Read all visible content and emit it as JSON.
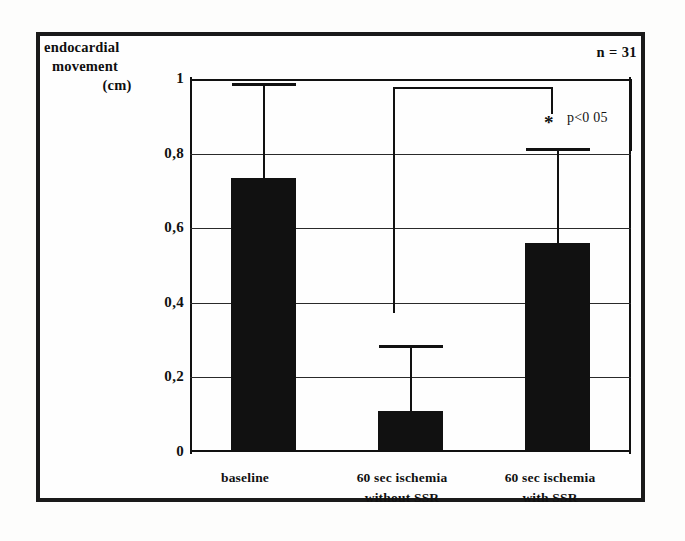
{
  "figure": {
    "axis_title_lines": [
      "endocardial",
      "movement",
      "(cm)"
    ],
    "n_label": "n = 31",
    "p_label": "p<0 05",
    "significance_marker": "*"
  },
  "chart_data": {
    "type": "bar",
    "title": "",
    "xlabel": "",
    "ylabel": "endocardial movement (cm)",
    "ylim": [
      0,
      1
    ],
    "grid": true,
    "legend": "none",
    "ytick_labels": [
      "1",
      "0,8",
      "0,6",
      "0,4",
      "0,2",
      "0"
    ],
    "ytick_values": [
      1,
      0.8,
      0.6,
      0.4,
      0.2,
      0
    ],
    "categories": [
      "baseline",
      "60 sec ischemia without SSR",
      "60 sec ischemia with SSR"
    ],
    "category_label_lines": [
      [
        "baseline"
      ],
      [
        "60 sec ischemia",
        "without SSR"
      ],
      [
        "60 sec ischemia",
        "with SSR"
      ]
    ],
    "values": [
      0.73,
      0.105,
      0.555
    ],
    "error_upper": [
      0.99,
      0.287,
      0.815
    ],
    "annotations": [
      {
        "text": "*",
        "applies_to": "60 sec ischemia with SSR",
        "meaning": "p<0 05"
      },
      {
        "text": "n = 31",
        "meaning": "sample size"
      }
    ],
    "bar_color": "#111111",
    "axis_color": "#111111",
    "background_color": "#fefefe"
  }
}
